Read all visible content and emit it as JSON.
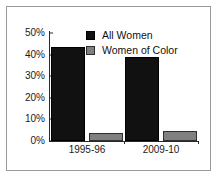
{
  "chart_data": {
    "type": "bar",
    "title": "",
    "subtitle": "",
    "xlabel": "",
    "ylabel": "",
    "categories": [
      "1995-96",
      "2009-10"
    ],
    "series": [
      {
        "name": "All Women",
        "values": [
          43.5,
          39
        ],
        "color": "#111111"
      },
      {
        "name": "Women of Color",
        "values": [
          3.5,
          4.5
        ],
        "color": "#808080"
      }
    ],
    "ylim": [
      0,
      50
    ],
    "yticks": [
      0,
      10,
      20,
      30,
      40,
      50
    ],
    "ytick_labels": [
      "0%",
      "10%",
      "20%",
      "30%",
      "40%",
      "50%"
    ],
    "grid": false,
    "legend_position": "top-center",
    "frame": true
  },
  "figure": {
    "background_color": "#ffffff",
    "frame_color": "#9a9a9a",
    "axis_color": "#2a2a2a",
    "text_color": "#1a1a1a"
  }
}
